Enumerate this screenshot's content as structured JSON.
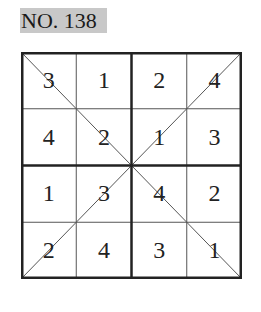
{
  "title": "NO. 138",
  "grid": {
    "size": 4,
    "rows": [
      [
        "3",
        "1",
        "2",
        "4"
      ],
      [
        "4",
        "2",
        "1",
        "3"
      ],
      [
        "1",
        "3",
        "4",
        "2"
      ],
      [
        "2",
        "4",
        "3",
        "1"
      ]
    ],
    "diagonals": true
  }
}
